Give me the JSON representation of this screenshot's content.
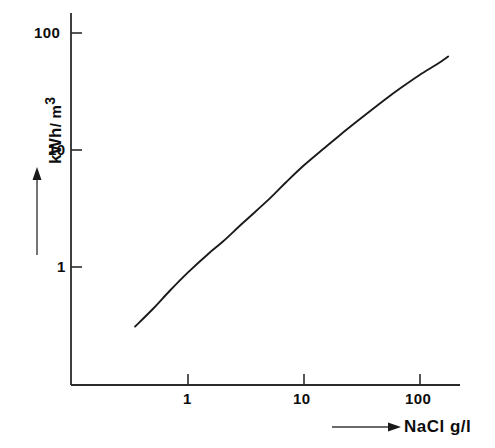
{
  "chart_data": {
    "type": "line",
    "title": "",
    "xlabel": "NaCl g/l",
    "ylabel": "kWh / m3",
    "ylabel_parts": {
      "main": "kWh",
      "unit": "/ m",
      "exponent": "3"
    },
    "xscale": "log",
    "yscale": "log",
    "xlim": [
      0.28,
      200
    ],
    "ylim": [
      0.2,
      130
    ],
    "grid": false,
    "legend": null,
    "xticks": [
      1,
      10,
      100
    ],
    "xtick_labels": [
      "1",
      "10",
      "100"
    ],
    "yticks": [
      1,
      10,
      100
    ],
    "ytick_labels": [
      "1",
      "10",
      "100"
    ],
    "series": [
      {
        "name": "Energy demand vs NaCl concentration",
        "x": [
          0.35,
          0.5,
          0.7,
          1.0,
          1.5,
          2.0,
          3.0,
          5.0,
          7.0,
          10.0,
          15.0,
          20.0,
          30.0,
          50.0,
          70.0,
          100.0,
          140.0,
          175.0
        ],
        "y": [
          0.31,
          0.44,
          0.63,
          0.9,
          1.3,
          1.65,
          2.4,
          3.8,
          5.3,
          7.4,
          10.4,
          13.2,
          18.2,
          27.0,
          34.5,
          44.0,
          54.0,
          63.0
        ]
      }
    ]
  },
  "axis_geometry": {
    "x_pixel_at_1": 188,
    "x_pixel_per_decade": 116,
    "y_pixel_at_1": 267,
    "y_pixel_per_decade": 117,
    "axis_left_px": 71,
    "axis_bottom_px": 385,
    "axis_top_px": 13,
    "axis_right_px": 460
  },
  "colors": {
    "background": "#ffffff",
    "axis": "#2b2b2b",
    "curve": "#1a1a1a",
    "text": "#0d0d0d"
  }
}
